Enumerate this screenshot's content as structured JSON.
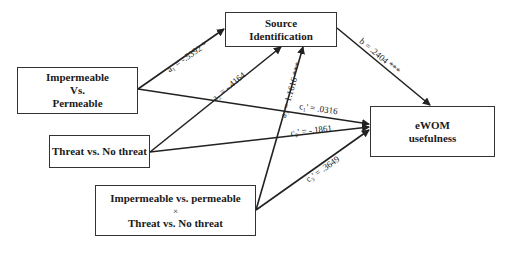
{
  "nodes": {
    "source": {
      "line1": "Source",
      "line2": "Identification"
    },
    "iv1": {
      "line1": "Impermeable",
      "line2": "Vs.",
      "line3": "Permeable"
    },
    "iv2": {
      "line1": "Threat vs. No threat"
    },
    "interaction": {
      "line1": "Impermeable vs. permeable",
      "line2": "×",
      "line3": "Threat vs. No threat"
    },
    "dv": {
      "line1": "eWOM",
      "line2": "usefulness"
    }
  },
  "paths": {
    "a1": "a₁ = -.5392 *",
    "a2": "a₂ = -.4164",
    "a3": "a₃ = 1.1616 ***",
    "b": "b = .2404 ***",
    "c1": "c₁' = .0316",
    "c2": "c₂' = -.1861",
    "c3": "c₃' = .3649"
  }
}
